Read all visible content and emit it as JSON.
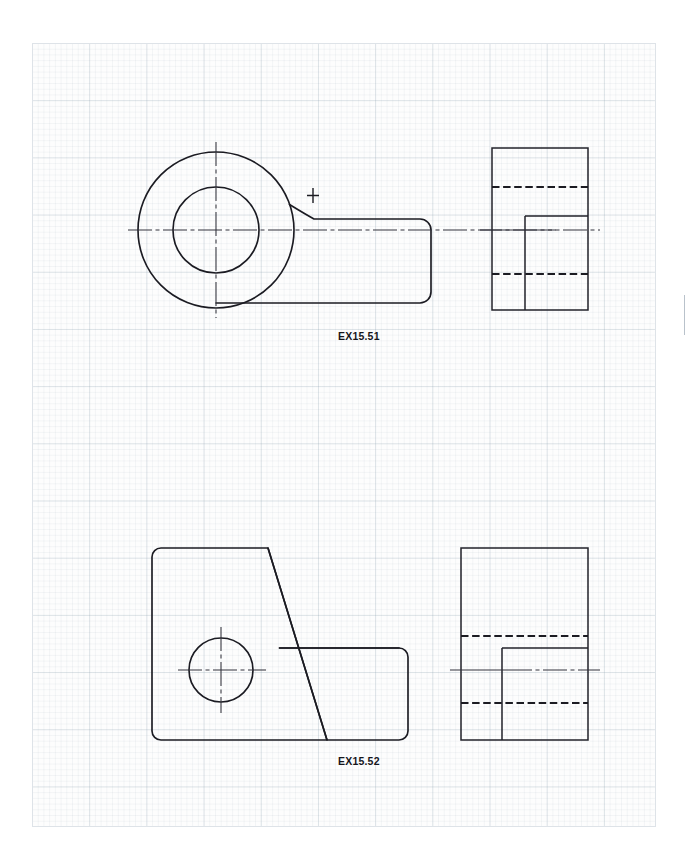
{
  "sheet": {
    "background": "#ffffff",
    "paper": {
      "name": "engineering-grid-paper",
      "fine_grid_px": 5.72,
      "major_grid_px": 57.2,
      "grid_color": "#8ca0af",
      "paper_color": "#fdfdfd"
    },
    "line_colors": {
      "object_line": "#1b1b22",
      "hidden_line": "#1b1b22",
      "center_line": "#33333c"
    }
  },
  "drawings": [
    {
      "id": "ex15-51",
      "label": "EX15.51",
      "label_x": 338,
      "label_y": 330,
      "views": [
        {
          "name": "front-view-circular-boss-with-arm",
          "type": "front",
          "geometry": {
            "circle_center": [
              216,
              230
            ],
            "outer_circle_radius": 78,
            "inner_circle_radius": 43,
            "arm_top_y": 219,
            "arm_bottom_y": 303,
            "arm_right_x": 431,
            "arm_corner_radius": 11,
            "fillet_center_mark": [
              313,
              195
            ],
            "fillet_radius": 26
          }
        },
        {
          "name": "side-view-sectioned-block",
          "type": "side",
          "geometry": {
            "rect": [
              492,
              148,
              588,
              310
            ],
            "hidden_lines_y": [
              187,
              274
            ],
            "step_vertical_x": 525,
            "step_vertical_from_y": 216,
            "step_horizontal_y": 216,
            "center_line_y": 230
          }
        }
      ]
    },
    {
      "id": "ex15-52",
      "label": "EX15.52",
      "label_x": 338,
      "label_y": 755,
      "views": [
        {
          "name": "front-view-angled-bracket",
          "type": "front",
          "geometry": {
            "left_x": 152,
            "top_y": 548,
            "bottom_y": 740,
            "ledge_top_y": 648,
            "right_x": 408,
            "diagonal_from": [
              268,
              548
            ],
            "diagonal_to": [
              327,
              740
            ],
            "corner_radius": 9,
            "hole_center": [
              221,
              670
            ],
            "hole_radius": 32
          }
        },
        {
          "name": "side-view-stepped-block",
          "type": "side",
          "geometry": {
            "rect": [
              461,
              548,
              588,
              740
            ],
            "hidden_lines_y": [
              636,
              703
            ],
            "step_vertical_x": 502,
            "step_horizontal_y": 648,
            "center_line_y": 670
          }
        }
      ]
    }
  ]
}
